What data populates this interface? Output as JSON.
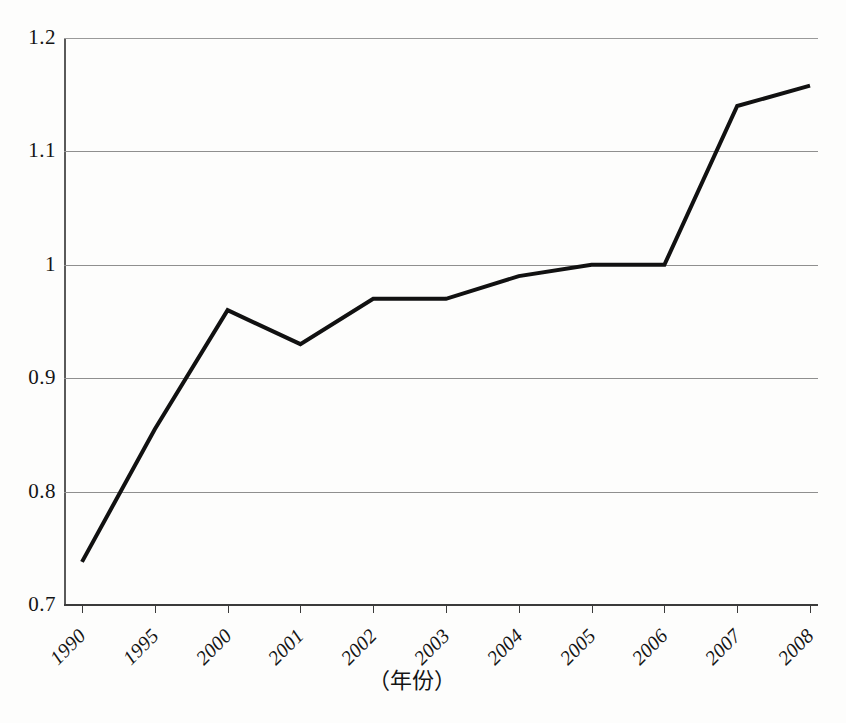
{
  "figure": {
    "background_color": "#fdfdfc",
    "line_color": "#111111",
    "grid_color": "#8f8f8f",
    "axis_color": "#3b3b3b"
  },
  "axes": {
    "x_axis_title": "（年份）",
    "y_tick_labels": [
      "1.2",
      "1.1",
      "1",
      "0.9",
      "0.8",
      "0.7"
    ],
    "x_tick_labels": [
      "1990",
      "1995",
      "2000",
      "2001",
      "2002",
      "2003",
      "2004",
      "2005",
      "2006",
      "2007",
      "2008"
    ]
  },
  "chart_data": {
    "type": "line",
    "title": "",
    "subtitle": "",
    "xlabel": "（年份）",
    "ylabel": "",
    "categories": [
      "1990",
      "1995",
      "2000",
      "2001",
      "2002",
      "2003",
      "2004",
      "2005",
      "2006",
      "2007",
      "2008"
    ],
    "values": [
      0.738,
      0.855,
      0.96,
      0.93,
      0.97,
      0.97,
      0.99,
      1.0,
      1.0,
      1.14,
      1.158
    ],
    "ylim": [
      0.7,
      1.2
    ],
    "ytick_values": [
      0.7,
      0.8,
      0.9,
      1.0,
      1.1,
      1.2
    ],
    "grid": true,
    "grid_axis": "y",
    "legend": false,
    "legend_position": "none",
    "annotations": []
  }
}
